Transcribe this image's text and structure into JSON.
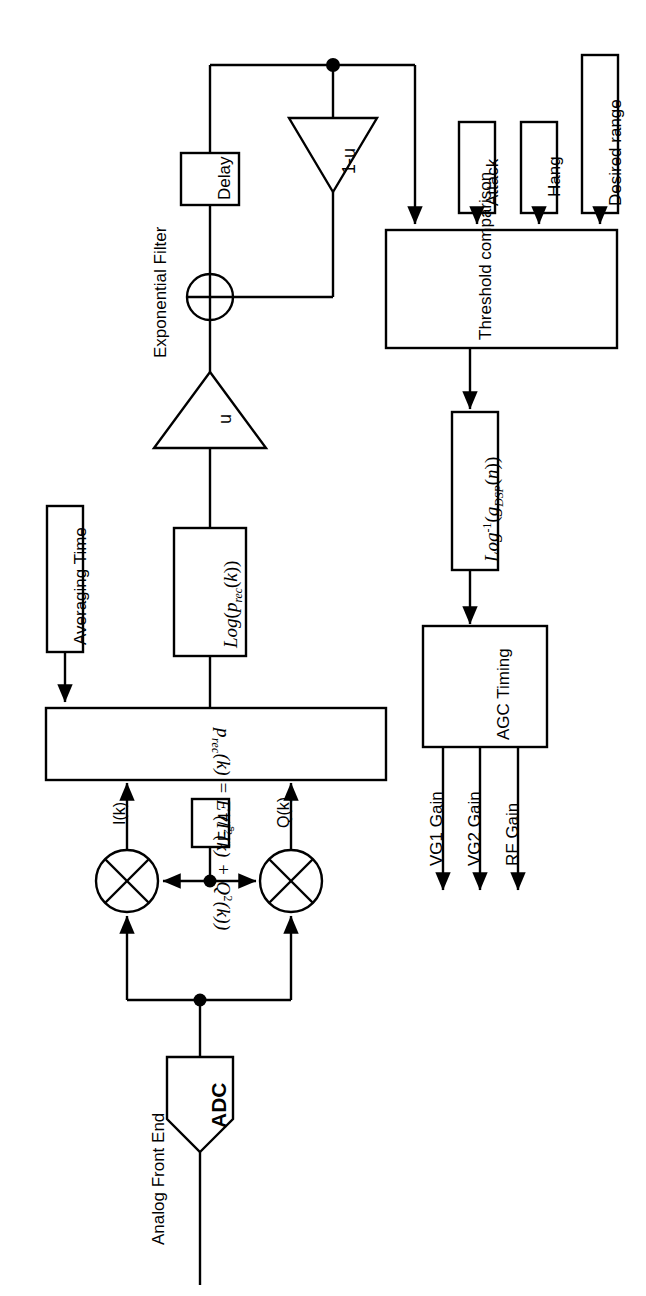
{
  "diagram": {
    "orientation": "rotated-90-ccw",
    "stroke_color": "#000000",
    "background_color": "#ffffff"
  },
  "labels": {
    "analog_front_end": "Analog Front End",
    "adc": "ADC",
    "i_branch": "I(k)",
    "q_branch": "Q(k)",
    "sample_clock": "Fₛ/4",
    "exponential_filter": "Exponential Filter",
    "averaging_time": "Averaging Time",
    "delay": "Delay",
    "gain_u": "u",
    "gain_one_minus_u": "1-u",
    "threshold_comparison": "Threshold comparison",
    "attack": "Attack",
    "hang": "Hang",
    "desired_range": "Desired range",
    "agc_timing": "AGC Timing",
    "vg1_gain": "VG1 Gain",
    "vg2_gain": "VG2 Gain",
    "rf_gain": "RF Gain"
  },
  "equations": {
    "power_estimate": {
      "lhs": "p",
      "lhs_sub": "rec",
      "lhs_arg": "(k) = E",
      "body": "( I²(k) + Q²(k) )",
      "full_text": "p_rec(k) = E( I²(k) + Q²(k) )"
    },
    "log_power": {
      "full_text": "Log( p_rec(k) )",
      "fn": "Log",
      "arg": "p",
      "arg_sub": "rec",
      "arg_tail": "(k)"
    },
    "inverse_log_gain": {
      "full_text": "Log⁻¹( g_DSP(n) )",
      "fn": "Log",
      "fn_sup": "-1",
      "arg": "g",
      "arg_sub": "DSP",
      "arg_tail": "(n)"
    }
  },
  "outputs": [
    {
      "name": "vg1",
      "label": "VG1 Gain"
    },
    {
      "name": "vg2",
      "label": "VG2 Gain"
    },
    {
      "name": "rf",
      "label": "RF Gain"
    }
  ],
  "threshold_inputs": [
    {
      "name": "attack",
      "label": "Attack"
    },
    {
      "name": "hang",
      "label": "Hang"
    },
    {
      "name": "desired_range",
      "label": "Desired range"
    }
  ]
}
